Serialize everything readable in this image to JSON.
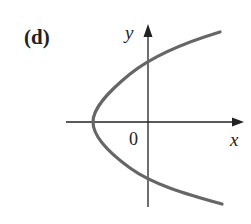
{
  "figure": {
    "panel_label": "(d)",
    "x_axis_label": "x",
    "y_axis_label": "y",
    "origin_label": "0",
    "curve": "parabola opening to the right",
    "colors": {
      "curve": "#666666",
      "axes": "#222222"
    }
  }
}
